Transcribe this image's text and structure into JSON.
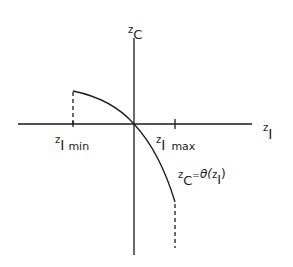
{
  "diagram": {
    "y_axis": {
      "var": "z",
      "sub": "C"
    },
    "x_axis": {
      "var": "z",
      "sub": "I"
    },
    "min_label": {
      "var": "z",
      "sub": "I",
      "suffix": "min"
    },
    "max_label": {
      "var": "z",
      "sub": "I",
      "suffix": "max"
    },
    "function_label": {
      "lhs_var": "z",
      "lhs_sub": "C",
      "eq": "=",
      "func": "θ(",
      "arg_var": "z",
      "arg_sub": "I",
      "close": ")"
    },
    "colors": {
      "ink": "#1a1a1a",
      "background": "#ffffff"
    }
  }
}
